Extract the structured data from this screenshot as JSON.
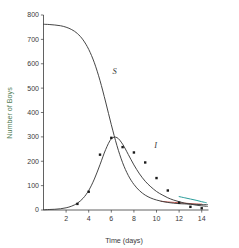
{
  "chart_data": {
    "type": "line",
    "title": "",
    "subtitle": "",
    "xlabel": "Time (days)",
    "ylabel": "Number of Boys",
    "xlim": [
      0,
      14.6
    ],
    "ylim": [
      0,
      800
    ],
    "xticks": [
      2,
      4,
      6,
      8,
      10,
      12,
      14
    ],
    "yticks": [
      0,
      100,
      200,
      300,
      400,
      500,
      600,
      700,
      800
    ],
    "xtick_labels": [
      "2",
      "4",
      "6",
      "8",
      "10",
      "12",
      "14"
    ],
    "ytick_labels": [
      "0",
      "100",
      "200",
      "300",
      "400",
      "500",
      "600",
      "700",
      "800"
    ],
    "grid": false,
    "legend_position": "inline-annotation",
    "annotations": [
      {
        "text": "S",
        "x": 6.1,
        "y": 560,
        "name": "susceptible-curve-label"
      },
      {
        "text": "I",
        "x": 9.8,
        "y": 255,
        "name": "infected-curve-label"
      }
    ],
    "series": [
      {
        "name": "S",
        "label": "S",
        "type": "line",
        "color": "#3c3c3c",
        "x": [
          0.0,
          0.5,
          1.0,
          1.5,
          2.0,
          2.5,
          3.0,
          3.5,
          4.0,
          4.5,
          5.0,
          5.5,
          6.0,
          6.5,
          7.0,
          7.5,
          8.0,
          8.5,
          9.0,
          9.5,
          10.0,
          10.5,
          11.0,
          11.5,
          12.0,
          12.5,
          13.0,
          13.5,
          14.0,
          14.5
        ],
        "values": [
          762,
          761,
          759,
          756,
          750,
          740,
          724,
          698,
          659,
          604,
          531,
          443,
          350,
          264,
          194,
          142,
          105,
          79,
          61,
          49,
          41,
          35,
          31,
          28,
          26,
          25,
          24,
          23,
          22,
          22
        ]
      },
      {
        "name": "I",
        "label": "I",
        "type": "line",
        "color": "#3c3c3c",
        "x": [
          0.0,
          0.5,
          1.0,
          1.5,
          2.0,
          2.5,
          3.0,
          3.5,
          4.0,
          4.5,
          5.0,
          5.5,
          6.0,
          6.5,
          7.0,
          7.5,
          8.0,
          8.5,
          9.0,
          9.5,
          10.0,
          10.5,
          11.0,
          11.5,
          12.0,
          12.5,
          13.0,
          13.5,
          14.0,
          14.5
        ],
        "values": [
          1,
          2,
          3,
          5,
          9,
          16,
          28,
          48,
          80,
          127,
          186,
          248,
          292,
          297,
          270,
          228,
          185,
          148,
          118,
          95,
          76,
          62,
          50,
          41,
          34,
          28,
          24,
          20,
          17,
          15
        ]
      },
      {
        "name": "I-observed",
        "label": "Observed infected",
        "type": "scatter",
        "color": "#1a1a1a",
        "x": [
          3,
          4,
          5,
          6,
          7,
          8,
          9,
          10,
          11,
          12,
          13,
          14
        ],
        "values": [
          25,
          75,
          227,
          296,
          258,
          236,
          195,
          131,
          80,
          30,
          13,
          7
        ]
      },
      {
        "name": "overlay-red",
        "label": "",
        "type": "line",
        "color": "#c8564e",
        "x": [
          10.4,
          11.0,
          11.6,
          12.2,
          12.8,
          13.4,
          14.0
        ],
        "values": [
          36,
          33,
          31,
          29,
          27,
          25,
          24
        ]
      },
      {
        "name": "overlay-teal",
        "label": "",
        "type": "line",
        "color": "#2a9d9a",
        "x": [
          12.0,
          12.5,
          13.0,
          13.5,
          14.0,
          14.4
        ],
        "values": [
          55,
          50,
          45,
          40,
          34,
          30
        ]
      }
    ]
  },
  "axes": {
    "x_title": "Time (days)",
    "y_title": "Number of Boys"
  },
  "colors": {
    "curve": "#3c3c3c",
    "points": "#1a1a1a",
    "overlay_red": "#c8564e",
    "overlay_teal": "#2a9d9a",
    "ylabel_text": "#4e7a52",
    "axis": "#3a3a3a"
  }
}
